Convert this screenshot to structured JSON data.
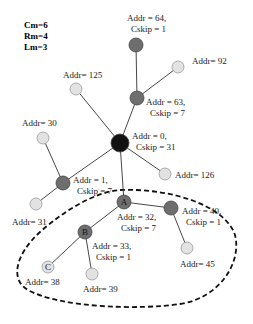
{
  "params": [
    "Cm=6",
    "Rm=4",
    "Lm=3"
  ],
  "colors": {
    "coordinator": "#111111",
    "router": "#6e6e6e",
    "end_device": "#e2e2e2",
    "edge": "#333333",
    "cluster_outline": "#111111"
  },
  "nodes": [
    {
      "id": "n0",
      "x": 120,
      "y": 143,
      "r": 9,
      "type": "coordinator",
      "letter": "",
      "label": [
        "Addr = 0,",
        "Cskip = 31"
      ],
      "lx": 132,
      "ly": 139
    },
    {
      "id": "n63",
      "x": 137,
      "y": 98,
      "r": 7,
      "type": "router",
      "letter": "",
      "label": [
        "Addr = 63,",
        "Cskip = 7"
      ],
      "lx": 146,
      "ly": 105
    },
    {
      "id": "n64",
      "x": 136,
      "y": 45,
      "r": 7,
      "type": "router",
      "letter": "",
      "label": [
        "Addr = 64,",
        "Cskip = 1"
      ],
      "lx": 127,
      "ly": 21
    },
    {
      "id": "n92",
      "x": 178,
      "y": 67,
      "r": 6,
      "type": "end_device",
      "letter": "",
      "label": [
        "Addr= 92"
      ],
      "lx": 192,
      "ly": 64
    },
    {
      "id": "n125",
      "x": 76,
      "y": 89,
      "r": 6,
      "type": "end_device",
      "letter": "",
      "label": [
        "Addr= 125"
      ],
      "lx": 63,
      "ly": 78
    },
    {
      "id": "n126",
      "x": 165,
      "y": 174,
      "r": 6,
      "type": "end_device",
      "letter": "",
      "label": [
        "Addr= 126"
      ],
      "lx": 175,
      "ly": 178
    },
    {
      "id": "n30",
      "x": 43,
      "y": 138,
      "r": 6,
      "type": "end_device",
      "letter": "",
      "label": [
        "Addr= 30"
      ],
      "lx": 22,
      "ly": 126
    },
    {
      "id": "n1",
      "x": 63,
      "y": 183,
      "r": 7,
      "type": "router",
      "letter": "",
      "label": [
        "Addr = 1,",
        "Cskip = 7"
      ],
      "lx": 73,
      "ly": 183
    },
    {
      "id": "n31",
      "x": 36,
      "y": 204,
      "r": 6,
      "type": "end_device",
      "letter": "",
      "label": [
        "Addr= 31"
      ],
      "lx": 12,
      "ly": 225
    },
    {
      "id": "n32",
      "x": 124,
      "y": 202,
      "r": 7,
      "type": "router",
      "letter": "A",
      "label": [
        "Addr = 32,",
        "Cskip = 7"
      ],
      "lx": 117,
      "ly": 220
    },
    {
      "id": "n40",
      "x": 171,
      "y": 208,
      "r": 7,
      "type": "router",
      "letter": "",
      "label": [
        "Addr = 40,",
        "Cskip = 1"
      ],
      "lx": 182,
      "ly": 214
    },
    {
      "id": "n45",
      "x": 187,
      "y": 248,
      "r": 6,
      "type": "end_device",
      "letter": "",
      "label": [
        "Addr= 45"
      ],
      "lx": 180,
      "ly": 267
    },
    {
      "id": "n33",
      "x": 85,
      "y": 232,
      "r": 7,
      "type": "router",
      "letter": "B",
      "label": [
        "Addr = 33,",
        "Cskip = 1"
      ],
      "lx": 92,
      "ly": 249
    },
    {
      "id": "n38",
      "x": 48,
      "y": 267,
      "r": 6,
      "type": "end_device",
      "letter": "C",
      "label": [
        "Addr= 38"
      ],
      "lx": 25,
      "ly": 285
    },
    {
      "id": "n39",
      "x": 92,
      "y": 274,
      "r": 6,
      "type": "end_device",
      "letter": "",
      "label": [
        "Addr= 39"
      ],
      "lx": 83,
      "ly": 292
    }
  ],
  "edges": [
    [
      "n0",
      "n63"
    ],
    [
      "n63",
      "n64"
    ],
    [
      "n63",
      "n92"
    ],
    [
      "n0",
      "n125"
    ],
    [
      "n0",
      "n126"
    ],
    [
      "n0",
      "n1"
    ],
    [
      "n1",
      "n30"
    ],
    [
      "n1",
      "n31"
    ],
    [
      "n0",
      "n32"
    ],
    [
      "n32",
      "n40"
    ],
    [
      "n40",
      "n45"
    ],
    [
      "n32",
      "n33"
    ],
    [
      "n33",
      "n38"
    ],
    [
      "n33",
      "n39"
    ]
  ]
}
